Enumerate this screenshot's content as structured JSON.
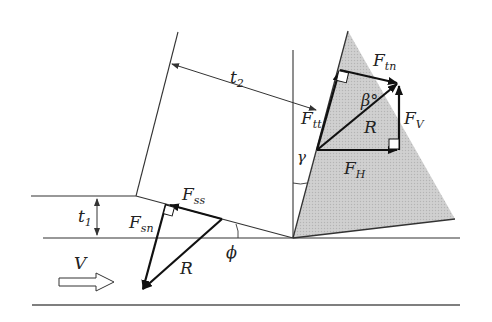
{
  "diagram": {
    "colors": {
      "line": "#333333",
      "vector": "#111111",
      "tool_fill": "#c8c8c8",
      "background": "#ffffff"
    },
    "labels": {
      "t2": {
        "main": "t",
        "sub": "2"
      },
      "t1": {
        "main": "t",
        "sub": "1"
      },
      "Ftt": {
        "main": "F",
        "sub": "tt"
      },
      "Ftn": {
        "main": "F",
        "sub": "tn"
      },
      "FV": {
        "main": "F",
        "sub": "V"
      },
      "FH": {
        "main": "F",
        "sub": "H"
      },
      "Fss": {
        "main": "F",
        "sub": "ss"
      },
      "Fsn": {
        "main": "F",
        "sub": "sn"
      },
      "R_tool": "R",
      "R_shear": "R",
      "beta": "β°",
      "gamma": "γ",
      "phi": "ϕ",
      "V": "V"
    },
    "components": [
      {
        "name": "workpiece",
        "description": "Uncut workpiece layer with thickness t1"
      },
      {
        "name": "chip",
        "description": "Chip with thickness t2 sliding up the rake face"
      },
      {
        "name": "tool",
        "description": "Shaded cutting tool with rake angle γ"
      },
      {
        "name": "shear-plane",
        "description": "Shear plane at angle ϕ"
      },
      {
        "name": "tool-force-triangle",
        "description": "R resolved into Ftt/Ftn and FH/FV, friction angle β"
      },
      {
        "name": "shear-force-triangle",
        "description": "R resolved into Fss and Fsn"
      },
      {
        "name": "velocity-arrow",
        "description": "Cutting velocity V"
      }
    ]
  }
}
